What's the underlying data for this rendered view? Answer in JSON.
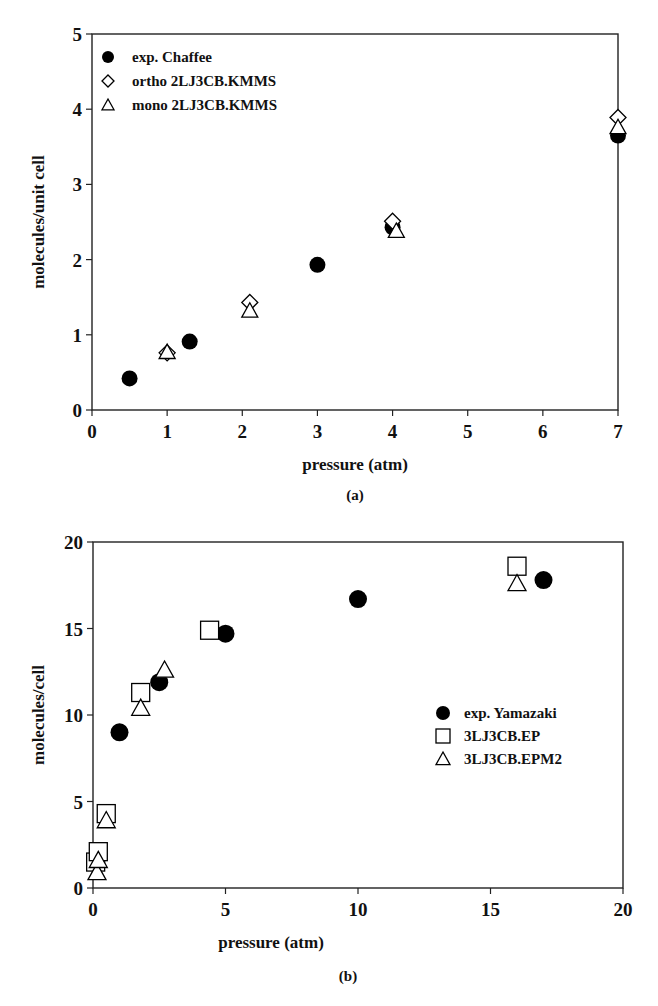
{
  "chart_data": [
    {
      "panel": "(a)",
      "type": "scatter",
      "xlabel": "pressure (atm)",
      "ylabel": "molecules/unit cell",
      "xlim": [
        0,
        7
      ],
      "ylim": [
        0,
        5
      ],
      "xticks": [
        "0",
        "1",
        "2",
        "3",
        "4",
        "5",
        "6",
        "7"
      ],
      "yticks": [
        "0",
        "1",
        "2",
        "3",
        "4",
        "5"
      ],
      "grid": false,
      "legend_position": "upper left",
      "series": [
        {
          "name": "exp. Chaffee",
          "marker": "filled-circle",
          "points": [
            [
              0.5,
              0.42
            ],
            [
              1.3,
              0.91
            ],
            [
              3.0,
              1.93
            ],
            [
              4.0,
              2.43
            ],
            [
              7.0,
              3.65
            ]
          ]
        },
        {
          "name": "ortho 2LJ3CB.KMMS",
          "marker": "open-diamond",
          "points": [
            [
              1.0,
              0.76
            ],
            [
              2.1,
              1.43
            ],
            [
              4.0,
              2.51
            ],
            [
              7.0,
              3.89
            ]
          ]
        },
        {
          "name": "mono 2LJ3CB.KMMS",
          "marker": "open-triangle",
          "points": [
            [
              1.0,
              0.77
            ],
            [
              2.1,
              1.32
            ],
            [
              4.05,
              2.38
            ],
            [
              7.0,
              3.76
            ]
          ]
        }
      ]
    },
    {
      "panel": "(b)",
      "type": "scatter",
      "xlabel": "pressure (atm)",
      "ylabel": "molecules/cell",
      "xlim": [
        0,
        20
      ],
      "ylim": [
        0,
        20
      ],
      "xticks": [
        "0",
        "5",
        "10",
        "15",
        "20"
      ],
      "yticks": [
        "0",
        "5",
        "10",
        "15",
        "20"
      ],
      "grid": false,
      "legend_position": "center right",
      "series": [
        {
          "name": "exp. Yamazaki",
          "marker": "filled-circle",
          "points": [
            [
              1.0,
              9.0
            ],
            [
              2.5,
              11.9
            ],
            [
              5.0,
              14.7
            ],
            [
              10.0,
              16.7
            ],
            [
              17.0,
              17.8
            ]
          ]
        },
        {
          "name": "3LJ3CB.EP",
          "marker": "open-square",
          "points": [
            [
              0.1,
              1.5
            ],
            [
              0.2,
              2.1
            ],
            [
              0.5,
              4.3
            ],
            [
              1.8,
              11.3
            ],
            [
              4.4,
              14.9
            ],
            [
              16.0,
              18.6
            ]
          ]
        },
        {
          "name": "3LJ3CB.EPM2",
          "marker": "open-triangle",
          "points": [
            [
              0.15,
              0.9
            ],
            [
              0.2,
              1.6
            ],
            [
              0.5,
              3.9
            ],
            [
              1.8,
              10.4
            ],
            [
              2.7,
              12.6
            ],
            [
              16.0,
              17.6
            ]
          ]
        }
      ]
    }
  ],
  "panels": {
    "a": {
      "label": "(a)",
      "xlabel": "pressure (atm)",
      "ylabel": "molecules/unit cell",
      "legend": [
        "exp. Chaffee",
        "ortho 2LJ3CB.KMMS",
        "mono 2LJ3CB.KMMS"
      ]
    },
    "b": {
      "label": "(b)",
      "xlabel": "pressure (atm)",
      "ylabel": "molecules/cell",
      "legend": [
        "exp. Yamazaki",
        "3LJ3CB.EP",
        "3LJ3CB.EPM2"
      ]
    }
  }
}
